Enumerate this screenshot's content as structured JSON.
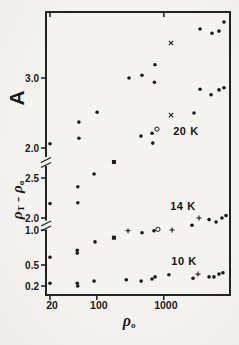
{
  "figure": {
    "ink_color": "#1a1a1a",
    "paper_color": "#f4f2ef"
  },
  "chart_data": {
    "type": "scatter",
    "title": "",
    "x_axis": {
      "label": {
        "base": "ρ",
        "sub": "o"
      },
      "scale": "log",
      "range": [
        16,
        9800
      ],
      "ticks": [
        {
          "v": 20,
          "label": "20"
        },
        {
          "v": 100,
          "label": "100"
        },
        {
          "v": 1000,
          "label": "1000"
        }
      ],
      "top_ticks": [
        20,
        1000
      ]
    },
    "y_axis": {
      "label_top": "A",
      "label_bottom": {
        "p1": "ρ",
        "s1": "T",
        "op": " - ",
        "p2": "ρ",
        "s2": "o"
      },
      "note": "single left axis with two breaks; three stacked linear sections",
      "sections": [
        {
          "id": "A",
          "quantity": "A",
          "range_shown": [
            1.9,
            3.95
          ],
          "ticks": [
            {
              "v": 3.0,
              "label": "3.0"
            },
            {
              "v": 2.0,
              "label": "2.0"
            }
          ]
        },
        {
          "id": "B",
          "quantity": "rho_T_minus_rho_0_upper",
          "range_shown": [
            1.9,
            2.7
          ],
          "ticks": [
            {
              "v": 2.5,
              "label": "2.5"
            },
            {
              "v": 2.0,
              "label": "2.0"
            }
          ]
        },
        {
          "id": "C",
          "quantity": "rho_T_minus_rho_0_lower",
          "range_shown": [
            0.07,
            1.03
          ],
          "ticks": [
            {
              "v": 1.0,
              "label": "1.0"
            },
            {
              "v": 0.5,
              "label": "0.5"
            },
            {
              "v": 0.2,
              "label": "0.2"
            }
          ]
        }
      ]
    },
    "annotations": [
      {
        "text": "20 K",
        "x": 2140,
        "section": "A",
        "y": 2.24
      },
      {
        "text": "14 K",
        "x": 1930,
        "section": "B",
        "y": 2.15
      },
      {
        "text": "10 K",
        "x": 2000,
        "section": "C",
        "y": 0.56
      }
    ],
    "series": [
      {
        "name": "A-values-dots",
        "marker": "dot",
        "section": "A",
        "points": [
          [
            20,
            2.06
          ],
          [
            54,
            2.37
          ],
          [
            54,
            2.14
          ],
          [
            101,
            2.51
          ],
          [
            302,
            3.0
          ],
          [
            456,
            2.17
          ],
          [
            472,
            3.04
          ],
          [
            666,
            2.21
          ],
          [
            683,
            2.07
          ],
          [
            723,
            2.94
          ],
          [
            738,
            3.19
          ],
          [
            2820,
            2.5
          ],
          [
            3470,
            3.7
          ],
          [
            3470,
            2.84
          ],
          [
            5070,
            2.76
          ],
          [
            5230,
            3.64
          ],
          [
            6660,
            3.67
          ],
          [
            6660,
            2.83
          ],
          [
            7900,
            3.8
          ],
          [
            7900,
            2.86
          ]
        ]
      },
      {
        "name": "A-values-crosses",
        "marker": "x",
        "section": "A",
        "points": [
          [
            1280,
            3.5
          ],
          [
            1280,
            2.47
          ]
        ]
      },
      {
        "name": "A-open-circle",
        "marker": "circle",
        "section": "A",
        "points": [
          [
            790,
            2.27
          ]
        ]
      },
      {
        "name": "20K-band-dots",
        "marker": "dot",
        "section": "B",
        "points": [
          [
            20,
            2.18
          ],
          [
            52,
            2.19
          ],
          [
            52,
            2.39
          ],
          [
            91,
            2.55
          ]
        ]
      },
      {
        "name": "20K-band-square",
        "marker": "square",
        "section": "B",
        "points": [
          [
            180,
            2.7
          ]
        ]
      },
      {
        "name": "14K-band-upper-dots",
        "marker": "dot",
        "section": "B",
        "points": [
          [
            2630,
            1.91
          ],
          [
            4730,
            1.98
          ],
          [
            6020,
            1.95
          ],
          [
            7370,
            2.0
          ],
          [
            8470,
            2.03
          ]
        ]
      },
      {
        "name": "14K-band-upper-plus",
        "marker": "plus",
        "section": "B",
        "points": [
          [
            3350,
            2.0
          ]
        ]
      },
      {
        "name": "14K-band-lower-dots",
        "marker": "dot",
        "section": "C",
        "points": [
          [
            20,
            0.61
          ],
          [
            51,
            0.71
          ],
          [
            51,
            0.67
          ],
          [
            94,
            0.83
          ],
          [
            473,
            0.96
          ],
          [
            713,
            0.99
          ]
        ]
      },
      {
        "name": "14K-band-lower-plus",
        "marker": "plus",
        "section": "C",
        "points": [
          [
            292,
            0.99
          ],
          [
            1330,
            1.0
          ]
        ]
      },
      {
        "name": "14K-open-circle",
        "marker": "circle",
        "section": "C",
        "points": [
          [
            817,
            1.01
          ]
        ]
      },
      {
        "name": "14K-band-square",
        "marker": "square",
        "section": "C",
        "points": [
          [
            180,
            0.89
          ]
        ]
      },
      {
        "name": "10K-band-dots",
        "marker": "dot",
        "section": "C",
        "points": [
          [
            20,
            0.24
          ],
          [
            51,
            0.24
          ],
          [
            52,
            0.2
          ],
          [
            91,
            0.27
          ],
          [
            275,
            0.29
          ],
          [
            459,
            0.27
          ],
          [
            666,
            0.3
          ],
          [
            739,
            0.33
          ],
          [
            1190,
            0.36
          ],
          [
            2730,
            0.31
          ],
          [
            4730,
            0.33
          ],
          [
            5600,
            0.33
          ],
          [
            6660,
            0.37
          ],
          [
            7620,
            0.39
          ]
        ]
      },
      {
        "name": "10K-band-plus",
        "marker": "plus",
        "section": "C",
        "points": [
          [
            3240,
            0.37
          ]
        ]
      }
    ]
  }
}
